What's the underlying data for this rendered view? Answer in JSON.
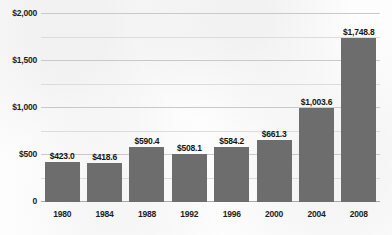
{
  "chart_data": {
    "type": "bar",
    "title": "",
    "subtitle": "",
    "xlabel": "",
    "ylabel": "",
    "categories": [
      "1980",
      "1984",
      "1988",
      "1992",
      "1996",
      "2000",
      "2004",
      "2008"
    ],
    "values": [
      423.0,
      418.6,
      590.4,
      508.1,
      584.2,
      661.3,
      1003.6,
      1748.8
    ],
    "data_labels": [
      "$423.0",
      "$418.6",
      "$590.4",
      "$508.1",
      "$584.2",
      "$661.3",
      "$1,003.6",
      "$1,748.8"
    ],
    "ylim": [
      0,
      2000
    ],
    "y_major_ticks": [
      0,
      500,
      1000,
      1500,
      2000
    ],
    "y_major_tick_labels": [
      "0",
      "$500",
      "$1,000",
      "$1,500",
      "$2,000"
    ],
    "y_minor_ticks": [
      250,
      750,
      1250,
      1750
    ],
    "grid": true,
    "legend": false,
    "legend_position": "none",
    "bar_color": "#6d6d6d",
    "grid_color": "#c9c9c9",
    "background_color": "#fdfdfd",
    "text_color": "#1d1d1d"
  }
}
